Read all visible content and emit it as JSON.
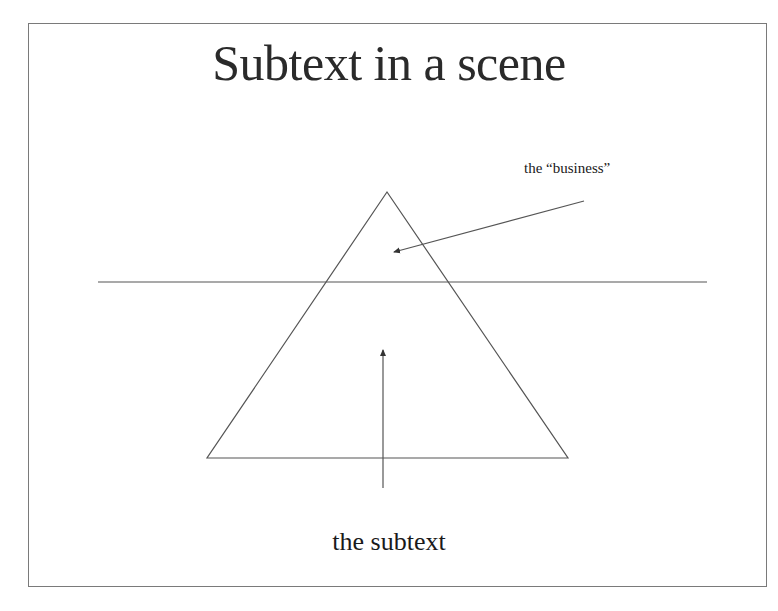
{
  "slide": {
    "title": "Subtext in a scene",
    "labels": {
      "business": "the “business”",
      "subtext": "the subtext"
    },
    "colors": {
      "line": "#555555",
      "text": "#1a1a1a",
      "border": "#7a7a7a"
    }
  }
}
